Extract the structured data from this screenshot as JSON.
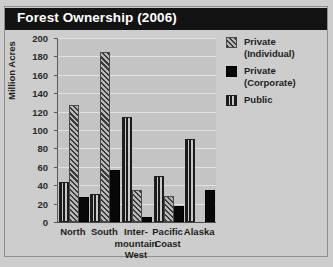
{
  "chart_data": {
    "type": "bar",
    "title": "Forest Ownership (2006)",
    "xlabel": "",
    "ylabel": "Million Acres",
    "ylim": [
      0,
      200
    ],
    "ytick_step": 20,
    "yticks": [
      0,
      20,
      40,
      60,
      80,
      100,
      120,
      140,
      160,
      180,
      200
    ],
    "ytick_labels": [
      "0",
      "20",
      "40",
      "60",
      "80",
      "100",
      "120",
      "140",
      "160",
      "180",
      "200"
    ],
    "grid": true,
    "legend_position": "right",
    "categories": [
      "North",
      "South",
      "Inter-mountain West",
      "Pacific Coast",
      "Alaska"
    ],
    "category_labels": [
      "North",
      "South",
      "Inter-\nmountain\nWest",
      "Pacific\nCoast",
      "Alaska"
    ],
    "series": [
      {
        "name": "Public",
        "legend_label": "Public",
        "pattern": "vertical-stripes",
        "color": "#1f1f1f",
        "values": [
          43,
          30,
          114,
          50,
          90
        ]
      },
      {
        "name": "Private (Individual)",
        "legend_label": "Private\n(Individual)",
        "pattern": "diagonal-hatch",
        "color": "#6e6e6e",
        "values": [
          127,
          185,
          35,
          28,
          0
        ]
      },
      {
        "name": "Private (Corporate)",
        "legend_label": "Private\n(Corporate)",
        "pattern": "solid",
        "color": "#080808",
        "values": [
          27,
          56,
          5,
          17,
          35
        ]
      }
    ]
  },
  "figure": {
    "title": "Forest Ownership (2006)",
    "background_color": "#cdcdcd",
    "plot_background_color": "#c4c4c4",
    "title_bar_color": "#131313",
    "title_text_color": "#ffffff",
    "gridline_color": "#e2e2e2"
  },
  "legend": {
    "entries": [
      {
        "label": "Private\n(Individual)",
        "swatch": "diagonal-hatch"
      },
      {
        "label": "Private\n(Corporate)",
        "swatch": "solid-black"
      },
      {
        "label": "Public",
        "swatch": "vertical-stripes"
      }
    ]
  },
  "axis": {
    "y_title": "Million Acres"
  }
}
